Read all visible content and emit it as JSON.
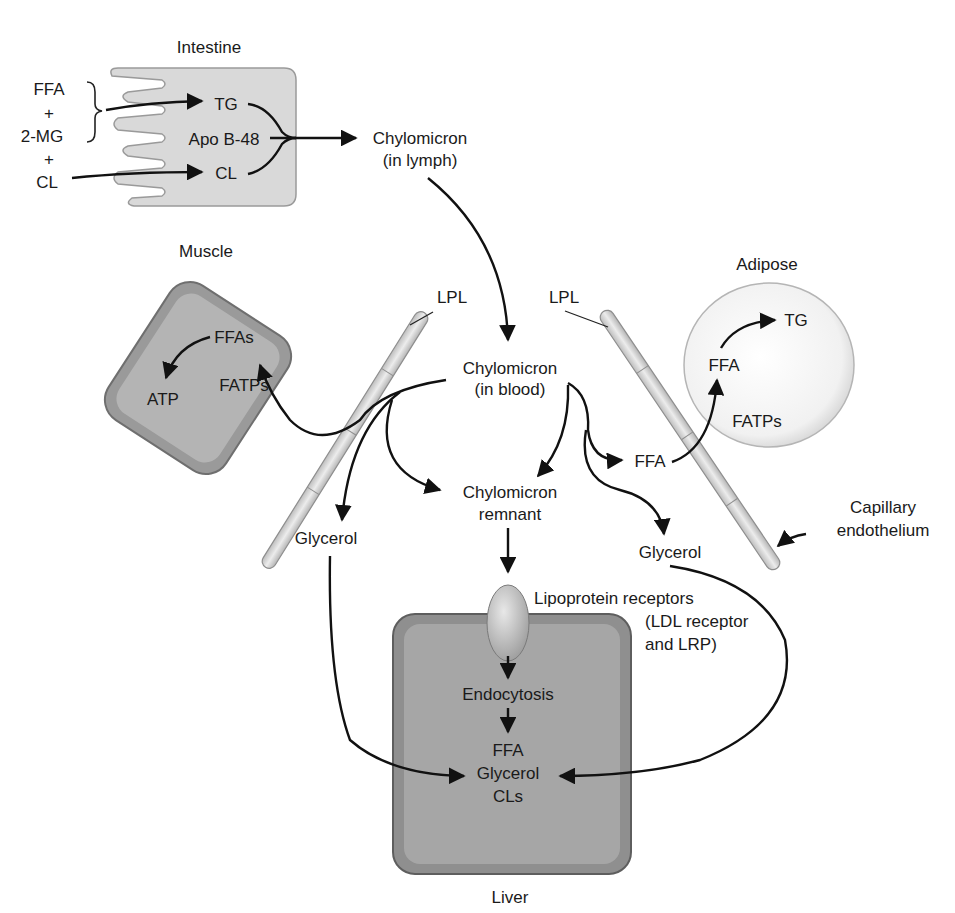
{
  "diagram": {
    "colors": {
      "intestine_fill": "#d9d9d9",
      "muscle_fill": "#9a9a9a",
      "liver_fill": "#8f8f8f",
      "adipose_fill": "#f2f2f2",
      "capillary_fill": "#d6d6d6",
      "arrow": "#111111",
      "text": "#1a1a1a"
    },
    "intestine": {
      "title": "Intestine",
      "inputs": {
        "ffa": "FFA",
        "plus1": "+",
        "mg": "2-MG",
        "plus2": "+",
        "cl": "CL"
      },
      "inside": {
        "tg": "TG",
        "apo": "Apo B-48",
        "cl": "CL"
      }
    },
    "chylomicron_lymph": {
      "line1": "Chylomicron",
      "line2": "(in lymph)"
    },
    "chylomicron_blood": {
      "line1": "Chylomicron",
      "line2": "(in blood)"
    },
    "chylomicron_remnant": {
      "line1": "Chylomicron",
      "line2": "remnant"
    },
    "muscle": {
      "title": "Muscle",
      "ffas": "FFAs",
      "atp": "ATP",
      "fatps": "FATPs"
    },
    "adipose": {
      "title": "Adipose",
      "tg": "TG",
      "ffa": "FFA",
      "fatps": "FATPs"
    },
    "lpl_left": "LPL",
    "lpl_right": "LPL",
    "ffa_blood": "FFA",
    "glycerol_left": "Glycerol",
    "glycerol_right": "Glycerol",
    "capillary": {
      "line1": "Capillary",
      "line2": "endothelium"
    },
    "receptors": {
      "line1": "Lipoprotein receptors",
      "line2": "(LDL receptor",
      "line3": "and LRP)"
    },
    "liver": {
      "title": "Liver",
      "endocytosis": "Endocytosis",
      "ffa": "FFA",
      "glycerol": "Glycerol",
      "cls": "CLs"
    }
  }
}
